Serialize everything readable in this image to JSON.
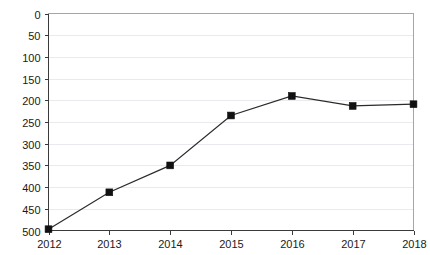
{
  "chart_data": {
    "type": "line",
    "title": "",
    "subtitle": "",
    "xlabel": "",
    "ylabel": "",
    "categories": [
      "2012",
      "2013",
      "2014",
      "2015",
      "2016",
      "2017",
      "2018"
    ],
    "x": [
      2012,
      2013,
      2014,
      2015,
      2016,
      2017,
      2018
    ],
    "values": [
      497,
      412,
      350,
      235,
      190,
      213,
      209
    ],
    "series": [
      {
        "name": "",
        "values": [
          497,
          412,
          350,
          235,
          190,
          213,
          209
        ],
        "line_color": "#2b2b2b",
        "marker": "square",
        "marker_color": "#111111"
      }
    ],
    "ylim": [
      0,
      500
    ],
    "y_inverted": true,
    "ytick_labels": [
      "0",
      "50",
      "100",
      "150",
      "200",
      "250",
      "300",
      "350",
      "400",
      "450",
      "500"
    ],
    "yticks": [
      0,
      50,
      100,
      150,
      200,
      250,
      300,
      350,
      400,
      450,
      500
    ],
    "xtick_labels": [
      "2012",
      "2013",
      "2014",
      "2015",
      "2016",
      "2017",
      "2018"
    ],
    "grid": true,
    "grid_axis": "y",
    "grid_color": "#e9e9ee",
    "legend": false,
    "legend_position": "none",
    "annotations": [],
    "frame_color": "#a6a6a6",
    "axis_color": "#3a3a3a",
    "background": "#ffffff"
  }
}
